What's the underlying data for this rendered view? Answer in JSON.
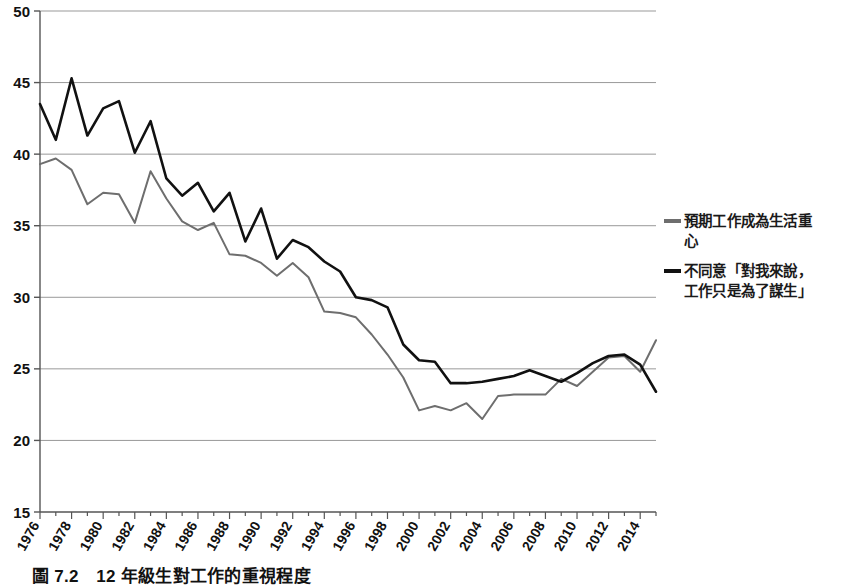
{
  "caption": "圖 7.2　12 年級生對工作的重視程度",
  "legend": {
    "position": "right",
    "entries": [
      {
        "label_line1": "預期工作成為生活重",
        "label_line2": "心",
        "color": "#6e6e6e",
        "name": "expect-work-central"
      },
      {
        "label_line1": "不同意「對我來說，",
        "label_line2": "工作只是為了謀生」",
        "color": "#111111",
        "name": "disagree-work-just-living"
      }
    ]
  },
  "chart_data": {
    "type": "line",
    "title": "圖 7.2　12 年級生對工作的重視程度",
    "xlabel": "",
    "ylabel": "",
    "xlim": [
      1976,
      2015
    ],
    "ylim": [
      15,
      50
    ],
    "ytick_values": [
      15,
      20,
      25,
      30,
      35,
      40,
      45,
      50
    ],
    "ytick_labels": [
      "15",
      "20",
      "25",
      "30",
      "35",
      "40",
      "45",
      "50"
    ],
    "xtick_values": [
      1976,
      1978,
      1980,
      1982,
      1984,
      1986,
      1988,
      1990,
      1992,
      1994,
      1996,
      1998,
      2000,
      2002,
      2004,
      2006,
      2008,
      2010,
      2012,
      2014
    ],
    "xtick_labels": [
      "1976",
      "1978",
      "1980",
      "1982",
      "1984",
      "1986",
      "1988",
      "1990",
      "1992",
      "1994",
      "1996",
      "1998",
      "2000",
      "2002",
      "2004",
      "2006",
      "2008",
      "2010",
      "2012",
      "2014"
    ],
    "xtick_rotation": -60,
    "grid": "horizontal",
    "grid_color": "#999999",
    "x": [
      1976,
      1977,
      1978,
      1979,
      1980,
      1981,
      1982,
      1983,
      1984,
      1985,
      1986,
      1987,
      1988,
      1989,
      1990,
      1991,
      1992,
      1993,
      1994,
      1995,
      1996,
      1997,
      1998,
      1999,
      2000,
      2001,
      2002,
      2003,
      2004,
      2005,
      2006,
      2007,
      2008,
      2009,
      2010,
      2011,
      2012,
      2013,
      2014,
      2015
    ],
    "series": [
      {
        "name": "預期工作成為生活重心",
        "color": "#6e6e6e",
        "linewidth": 2,
        "values": [
          39.3,
          39.7,
          38.9,
          36.5,
          37.3,
          37.2,
          35.2,
          38.8,
          36.9,
          35.3,
          34.7,
          35.2,
          33.0,
          32.9,
          32.4,
          31.5,
          32.4,
          31.4,
          29.0,
          28.9,
          28.6,
          27.4,
          26.0,
          24.4,
          22.1,
          22.4,
          22.1,
          22.6,
          21.5,
          23.1,
          23.2,
          23.2,
          23.2,
          24.3,
          23.8,
          24.8,
          25.8,
          25.9,
          24.8,
          27.0
        ]
      },
      {
        "name": "不同意「對我來說，工作只是為了謀生」",
        "color": "#111111",
        "linewidth": 2.6,
        "values": [
          43.5,
          41.0,
          45.3,
          41.3,
          43.2,
          43.7,
          40.1,
          42.3,
          38.3,
          37.1,
          38.0,
          36.0,
          37.3,
          33.9,
          36.2,
          32.7,
          34.0,
          33.5,
          32.5,
          31.8,
          30.0,
          29.8,
          29.3,
          26.7,
          25.6,
          25.5,
          24.0,
          24.0,
          24.1,
          24.3,
          24.5,
          24.9,
          24.5,
          24.1,
          24.7,
          25.4,
          25.9,
          26.0,
          25.3,
          23.4
        ]
      }
    ]
  }
}
